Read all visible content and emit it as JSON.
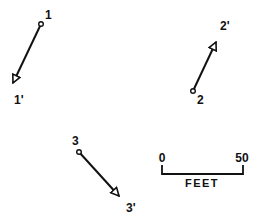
{
  "diagram": {
    "type": "displacement-vectors",
    "colors": {
      "ink": "#111111",
      "background": "#ffffff"
    },
    "vectors": [
      {
        "id": "1",
        "start_label": "1",
        "end_label": "1'",
        "start": [
          41,
          24
        ],
        "end": [
          11,
          87
        ],
        "start_label_pos": [
          45,
          19
        ],
        "end_label_pos": [
          17,
          104
        ]
      },
      {
        "id": "2",
        "start_label": "2",
        "end_label": "2'",
        "start": [
          193,
          91
        ],
        "end": [
          217,
          39
        ],
        "start_label_pos": [
          202,
          105
        ],
        "end_label_pos": [
          222,
          29
        ]
      },
      {
        "id": "3",
        "start_label": "3",
        "end_label": "3'",
        "start": [
          79,
          152
        ],
        "end": [
          121,
          198
        ],
        "start_label_pos": [
          76,
          144
        ],
        "end_label_pos": [
          131,
          212
        ]
      }
    ],
    "scale_bar": {
      "start_label": "0",
      "end_label": "50",
      "unit_label": "FEET"
    }
  }
}
